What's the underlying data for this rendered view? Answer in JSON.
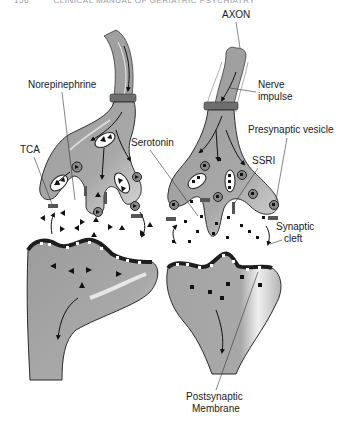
{
  "page_header": {
    "page_number": "156",
    "running_title": "CLINICAL MANUAL OF GERIATRIC PSYCHIATRY"
  },
  "diagram": {
    "labels": {
      "axon": "AXON",
      "nerve_impulse_line1": "Nerve",
      "nerve_impulse_line2": "impulse",
      "norepinephrine": "Norepinephrine",
      "tca": "TCA",
      "serotonin": "Serotonin",
      "presynaptic_vesicle": "Presynaptic vesicle",
      "ssri": "SSRI",
      "synaptic_cleft_line1": "Synaptic",
      "synaptic_cleft_line2": "cleft",
      "postsynaptic_line1": "Postsynaptic",
      "postsynaptic_line2": "Membrane"
    },
    "colors": {
      "neuron_fill": "#a6a6a6",
      "neuron_stroke": "#3a3a3a",
      "highlight": "#e6e6e6",
      "band": "#6e6e6e",
      "membrane": "#2b2b2b",
      "molecule": "#111111"
    },
    "legend": {
      "triangle_molecule": "norepinephrine",
      "square_molecule": "serotonin"
    }
  }
}
